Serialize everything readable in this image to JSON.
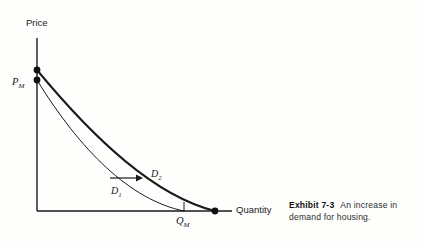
{
  "figure": {
    "kind": "economics-demand-shift-diagram",
    "background_color": "#fefefd",
    "ink_color": "#1a1a1a"
  },
  "graph": {
    "axes": {
      "y_axis_label": "Price",
      "x_axis_label": "Quantity",
      "y_axis": {
        "x": 37,
        "top": 38,
        "bottom": 211
      },
      "x_axis": {
        "y": 211,
        "left": 37,
        "right": 232
      }
    },
    "value_labels": {
      "price_symbol": "P",
      "price_subscript": "M",
      "quantity_symbol": "Q",
      "quantity_subscript": "M"
    },
    "curves": [
      {
        "name": "D1",
        "symbol": "D",
        "subscript": "1",
        "stroke_width": 1.0,
        "start": [
          37,
          80
        ],
        "end": [
          184,
          211
        ],
        "control_points": [
          [
            80,
            150
          ],
          [
            130,
            200
          ]
        ],
        "label_position": [
          111,
          186
        ]
      },
      {
        "name": "D2",
        "symbol": "D",
        "subscript": "2",
        "stroke_width": 2.0,
        "start": [
          37,
          70
        ],
        "end": [
          215,
          211
        ],
        "control_points": [
          [
            95,
            140
          ],
          [
            155,
            196
          ]
        ],
        "label_position": [
          151,
          169
        ]
      }
    ],
    "endpoint_dots": [
      {
        "name": "d2-price-intercept",
        "cx": 37,
        "cy": 70,
        "r": 3.4
      },
      {
        "name": "d1-price-intercept",
        "cx": 37,
        "cy": 80,
        "r": 3.4
      },
      {
        "name": "d2-quantity-intercept",
        "cx": 215,
        "cy": 211,
        "r": 3.4
      }
    ],
    "shift_arrow": {
      "from": [
        110,
        178
      ],
      "to": [
        136,
        178
      ],
      "direction": "right"
    },
    "quantity_tick": {
      "x": 184,
      "y_top": 202,
      "y_bottom": 211
    }
  },
  "caption": {
    "exhibit_label": "Exhibit 7-3",
    "description": "An increase in demand for housing."
  }
}
